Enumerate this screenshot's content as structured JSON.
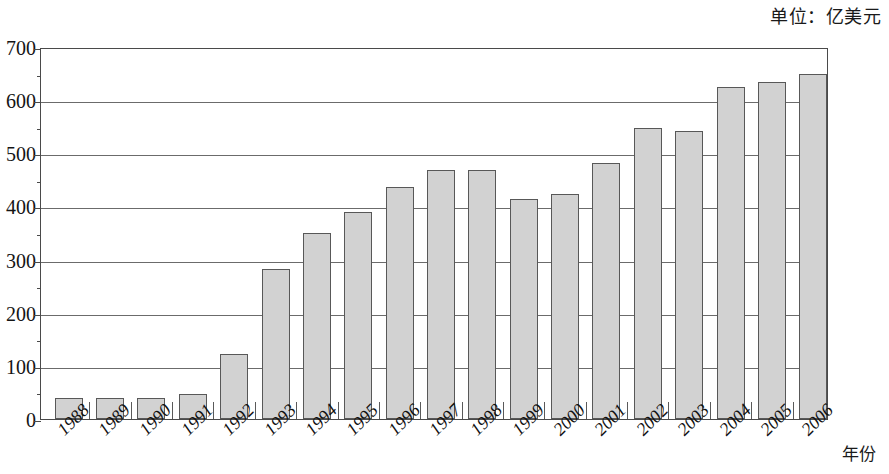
{
  "caption": {
    "unit_label": "单位：亿美元"
  },
  "axis": {
    "x_title": "年份",
    "y_ticks": [
      "700",
      "600",
      "500",
      "400",
      "300",
      "200",
      "100",
      "0"
    ]
  },
  "chart_data": {
    "type": "bar",
    "title": "",
    "subtitle": "",
    "xlabel": "年份",
    "ylabel": "",
    "unit": "单位：亿美元",
    "categories": [
      "1988",
      "1989",
      "1990",
      "1991",
      "1992",
      "1993",
      "1994",
      "1995",
      "1996",
      "1997",
      "1998",
      "1999",
      "2000",
      "2001",
      "2002",
      "2003",
      "2004",
      "2005",
      "2006"
    ],
    "values": [
      40,
      40,
      40,
      48,
      122,
      282,
      350,
      389,
      437,
      468,
      468,
      414,
      424,
      482,
      548,
      542,
      625,
      635,
      650
    ],
    "ylim": [
      0,
      700
    ],
    "ytick_step": 100,
    "yminor_step": 50,
    "grid": "horizontal",
    "legend": "none",
    "bar_color": "#d2d2d2",
    "bar_border_color": "#585858",
    "axis_color": "#4a4a4a"
  }
}
